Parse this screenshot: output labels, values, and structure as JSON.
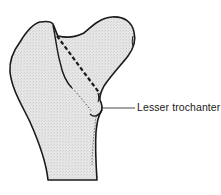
{
  "diagram": {
    "labels": [
      {
        "id": "lesser-trochanter",
        "text": "Lesser trochanter"
      }
    ],
    "styles": {
      "outline_color": "#1a1a1a",
      "fill_color": "#e4e4e4",
      "background": "#ffffff"
    },
    "annotations": {
      "dashed_line": "dashed line across femoral neck toward lesser trochanter"
    }
  }
}
